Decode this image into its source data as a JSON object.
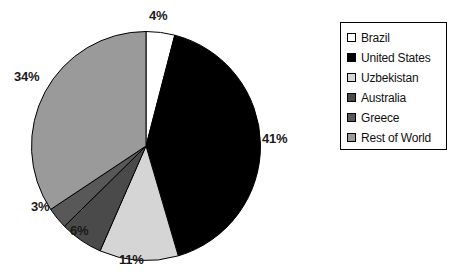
{
  "chart_data": {
    "type": "pie",
    "title": "",
    "labels": [
      "Brazil",
      "United States",
      "Uzbekistan",
      "Australia",
      "Greece",
      "Rest of World"
    ],
    "values": [
      4,
      41,
      11,
      6,
      3,
      34
    ],
    "value_labels": [
      "4%",
      "41%",
      "11%",
      "6%",
      "3%",
      "34%"
    ],
    "units": "percent",
    "start_angle_deg": 0,
    "direction": "clockwise",
    "legend_position": "right",
    "grid": false,
    "colors": [
      "#ffffff",
      "#000000",
      "#d5d5d5",
      "#4a4a4a",
      "#585858",
      "#9a9a9a"
    ],
    "slice_outline_color": "#000000"
  },
  "legend": {
    "items": [
      {
        "label": "Brazil",
        "color": "#ffffff"
      },
      {
        "label": "United States",
        "color": "#000000"
      },
      {
        "label": "Uzbekistan",
        "color": "#d5d5d5"
      },
      {
        "label": "Australia",
        "color": "#4a4a4a"
      },
      {
        "label": "Greece",
        "color": "#585858"
      },
      {
        "label": "Rest of World",
        "color": "#9a9a9a"
      }
    ]
  },
  "pie_labels": [
    {
      "text": "4%",
      "left": 149,
      "top": 8
    },
    {
      "text": "41%",
      "left": 262,
      "top": 131
    },
    {
      "text": "11%",
      "left": 119,
      "top": 252
    },
    {
      "text": "6%",
      "left": 70,
      "top": 223
    },
    {
      "text": "3%",
      "left": 31,
      "top": 199
    },
    {
      "text": "34%",
      "left": 14,
      "top": 69
    }
  ]
}
